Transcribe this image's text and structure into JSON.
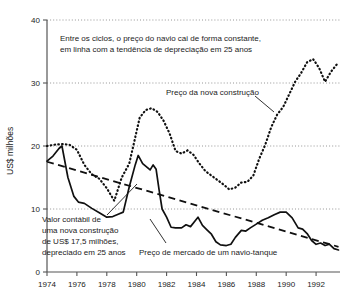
{
  "chart_data": {
    "type": "line",
    "title": "",
    "xlabel": "",
    "ylabel": "US$ milhões",
    "xlim": [
      1974,
      1993.6
    ],
    "ylim": [
      0,
      40
    ],
    "grid": true,
    "legend_position": "none",
    "x_ticks": [
      "1974",
      "1976",
      "1978",
      "1980",
      "1982",
      "1984",
      "1986",
      "1988",
      "1990",
      "1992"
    ],
    "x_tick_values": [
      1974,
      1976,
      1978,
      1980,
      1982,
      1984,
      1986,
      1988,
      1990,
      1992
    ],
    "y_ticks": [
      "0",
      "10",
      "20",
      "30",
      "40"
    ],
    "y_tick_values": [
      0,
      10,
      20,
      30,
      40
    ],
    "series": [
      {
        "name": "Preço da nova construção",
        "style": "dotted",
        "x": [
          1974.0,
          1974.5,
          1975.0,
          1975.5,
          1976.0,
          1976.5,
          1977.0,
          1977.5,
          1978.0,
          1978.5,
          1979.0,
          1979.5,
          1979.8,
          1980.2,
          1980.6,
          1981.0,
          1981.4,
          1981.8,
          1982.2,
          1982.6,
          1983.0,
          1983.4,
          1983.8,
          1984.2,
          1984.6,
          1985.0,
          1985.4,
          1985.8,
          1986.2,
          1986.6,
          1987.0,
          1987.4,
          1987.8,
          1988.2,
          1988.6,
          1989.0,
          1989.4,
          1989.8,
          1990.2,
          1990.6,
          1991.0,
          1991.4,
          1991.8,
          1992.2,
          1992.6,
          1993.0,
          1993.4
        ],
        "y": [
          20.0,
          20.2,
          20.3,
          20.2,
          19.4,
          17.0,
          15.5,
          14.8,
          13.3,
          11.3,
          15.0,
          17.2,
          20.3,
          24.5,
          25.7,
          26.0,
          25.4,
          24.0,
          22.0,
          19.2,
          18.8,
          19.3,
          18.6,
          17.2,
          16.0,
          15.3,
          14.6,
          13.9,
          13.1,
          13.4,
          14.2,
          14.3,
          15.3,
          18.0,
          20.2,
          23.0,
          25.0,
          26.2,
          28.2,
          30.2,
          31.6,
          33.3,
          33.8,
          32.4,
          30.2,
          31.8,
          33.0
        ]
      },
      {
        "name": "Preço de mercado de um navio-tanque",
        "style": "solid",
        "x": [
          1974.0,
          1974.4,
          1974.8,
          1975.0,
          1975.4,
          1975.8,
          1976.1,
          1976.5,
          1977.0,
          1977.5,
          1978.0,
          1978.4,
          1978.8,
          1979.1,
          1979.5,
          1979.9,
          1980.1,
          1980.4,
          1980.7,
          1980.9,
          1981.1,
          1981.3,
          1981.5,
          1981.7,
          1982.0,
          1982.3,
          1982.6,
          1983.0,
          1983.3,
          1983.6,
          1983.9,
          1984.1,
          1984.4,
          1984.7,
          1985.0,
          1985.3,
          1985.6,
          1986.0,
          1986.3,
          1986.6,
          1987.0,
          1987.3,
          1987.6,
          1988.0,
          1988.4,
          1988.8,
          1989.2,
          1989.6,
          1990.0,
          1990.4,
          1990.8,
          1991.1,
          1991.4,
          1991.7,
          1992.0,
          1992.3,
          1992.6,
          1992.9,
          1993.2,
          1993.5
        ],
        "y": [
          17.6,
          18.4,
          19.6,
          20.0,
          15.0,
          12.0,
          11.1,
          10.9,
          10.1,
          9.4,
          8.7,
          8.8,
          9.2,
          9.5,
          13.5,
          17.0,
          18.5,
          17.2,
          16.6,
          16.2,
          17.0,
          16.3,
          13.0,
          10.0,
          8.7,
          7.1,
          7.0,
          7.0,
          7.5,
          7.2,
          8.1,
          8.7,
          7.4,
          6.7,
          6.0,
          4.8,
          4.3,
          4.2,
          4.4,
          5.5,
          6.6,
          6.5,
          7.0,
          7.6,
          8.2,
          8.6,
          9.1,
          9.5,
          9.5,
          8.6,
          7.0,
          6.8,
          6.1,
          5.0,
          4.4,
          4.6,
          4.2,
          4.4,
          3.7,
          3.5
        ]
      },
      {
        "name": "Valor contábil de uma nova construção de US$ 17,5 milhões, depreciado em 25 anos",
        "style": "dashed",
        "x": [
          1974.0,
          1993.5
        ],
        "y": [
          17.5,
          4.0
        ]
      }
    ],
    "annotations": [
      {
        "name": "headline-note",
        "lines": [
          "Entre os ciclos, o preço do navio cai de forma constante,",
          "em linha com a tendência de depreciação em 25 anos"
        ]
      },
      {
        "name": "newbuild-label",
        "text": "Preço da nova construção"
      },
      {
        "name": "book-value-label",
        "lines": [
          "Valor contábil de",
          "uma nova construção",
          "de US$ 17,5 milhões,",
          "depreciado em 25 anos"
        ]
      },
      {
        "name": "market-price-label",
        "text": "Preço de mercado de um navio-tanque"
      }
    ]
  }
}
